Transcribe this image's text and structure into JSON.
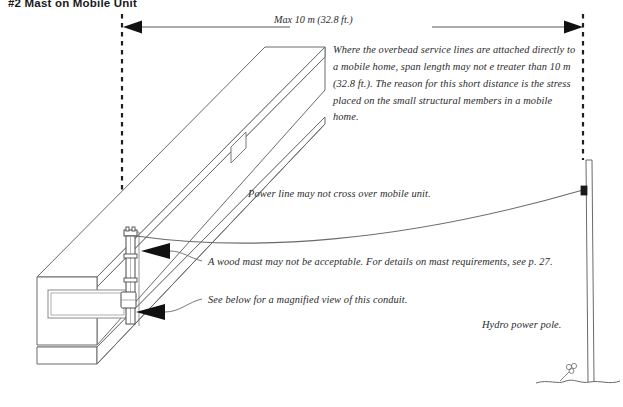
{
  "page": {
    "title": "#2 Mast on Mobile Unit",
    "background_color": "#ffffff",
    "line_color": "#4a4a4a",
    "text_color": "#2b2b2b",
    "width": 623,
    "height": 407
  },
  "dimension": {
    "label": "Max 10 m (32.8 ft.)",
    "arrow_style": "double-headed-between-dashed-extension-lines"
  },
  "notes": {
    "paragraph": "Where the overbead service lines are attached directly to a mobile home, span length may not e treater than 10 m (32.8 ft.). The reason for this short distance is the stress placed on the small structural members in a mobile home.",
    "power_line": "Power line may not cross over mobile unit.",
    "mast": "A wood mast may not be acceptable. For details on mast requirements, see p. 27.",
    "conduit": "See below for a magnified view of  this conduit.",
    "pole": "Hydro power pole."
  },
  "objects": {
    "mobile_home": "mobile-home-isometric-box",
    "mast": "service-mast-conduit-with-weatherhead",
    "meter": "meter-base",
    "window_end": "end-wall-window",
    "window_side": "side-wall-window",
    "skirting": "skirting-band",
    "service_drop": "overhead-service-drop-wire",
    "hydro_pole": "hydro-power-pole",
    "insulator": "pole-attachment-bracket",
    "ground_line": "ground-line",
    "shrub": "small-shrub"
  }
}
